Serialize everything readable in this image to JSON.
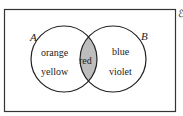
{
  "diagram": {
    "type": "venn",
    "universal_label": "ℰ",
    "sets": [
      {
        "name": "A",
        "only": [
          "orange",
          "yellow"
        ]
      },
      {
        "name": "B",
        "only": [
          "blue",
          "violet"
        ]
      }
    ],
    "intersection": [
      "red"
    ],
    "colors": {
      "stroke": "#222222",
      "intersection_fill": "#bdbdbd",
      "background": "#ffffff"
    }
  }
}
